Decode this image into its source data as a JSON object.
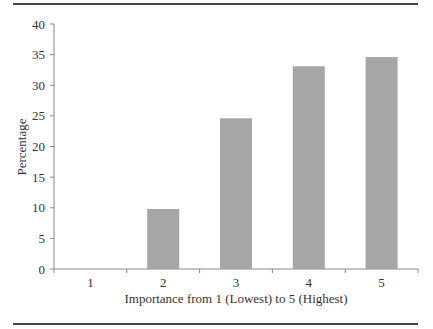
{
  "chart_data": {
    "type": "bar",
    "title": "",
    "xlabel": "Importance from 1 (Lowest) to 5 (Highest)",
    "ylabel": "Percentage",
    "categories": [
      "1",
      "2",
      "3",
      "4",
      "5"
    ],
    "values": [
      0,
      9.8,
      24.6,
      33.1,
      34.6
    ],
    "ylim": [
      0,
      40
    ],
    "yticks": [
      0,
      5,
      10,
      15,
      20,
      25,
      30,
      35,
      40
    ],
    "grid": false,
    "legend": null,
    "bar_color": "#a6a6a6"
  }
}
